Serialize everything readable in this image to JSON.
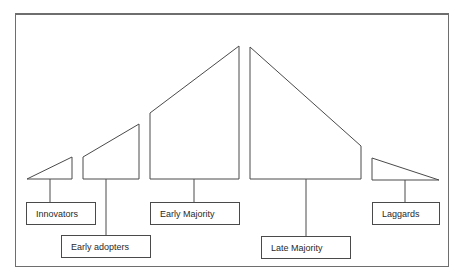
{
  "diagram": {
    "stroke_color": "#4a4a4a",
    "frame_color": "#6e6e6e",
    "categories": [
      {
        "id": "innovators",
        "label": "Innovators",
        "shape": "27,179 72,157 72,179",
        "stem": {
          "x": 50,
          "y1": 179,
          "y2": 202
        },
        "box": {
          "left": 26,
          "top": 202,
          "width": 70
        }
      },
      {
        "id": "early-adopters",
        "label": "Early adopters",
        "shape": "83,157 139,124 139,179 83,179",
        "stem": {
          "x": 106,
          "y1": 179,
          "y2": 235
        },
        "box": {
          "left": 61,
          "top": 235,
          "width": 90
        }
      },
      {
        "id": "early-majority",
        "label": "Early Majority",
        "shape": "150,113 239,46 239,179 150,179",
        "stem": {
          "x": 194,
          "y1": 179,
          "y2": 202
        },
        "box": {
          "left": 150,
          "top": 202,
          "width": 90
        }
      },
      {
        "id": "late-majority",
        "label": "Late Majority",
        "shape": "250,47 361,146 361,179 250,179",
        "stem": {
          "x": 306,
          "y1": 179,
          "y2": 236
        },
        "box": {
          "left": 261,
          "top": 236,
          "width": 90
        }
      },
      {
        "id": "laggards",
        "label": "Laggards",
        "shape": "372,158 439,180 372,180",
        "stem": {
          "x": 405,
          "y1": 180,
          "y2": 202
        },
        "box": {
          "left": 372,
          "top": 202,
          "width": 68
        }
      }
    ]
  }
}
